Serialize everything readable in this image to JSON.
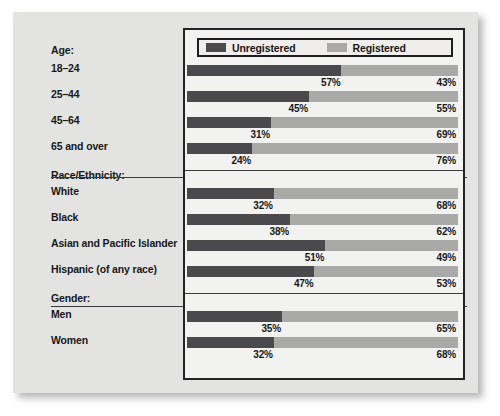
{
  "chart_data": {
    "type": "bar",
    "subtype": "stacked-horizontal-100-percent",
    "title": "",
    "xlabel": "",
    "ylabel": "",
    "xlim": [
      0,
      100
    ],
    "grid": false,
    "legend_position": "top-inside",
    "unit": "%",
    "legend": [
      {
        "name": "Unregistered",
        "color": "#4a4a4c"
      },
      {
        "name": "Registered",
        "color": "#a9a9a7"
      }
    ],
    "series": [
      {
        "name": "Unregistered",
        "color": "#4a4a4c",
        "values": [
          57,
          45,
          31,
          24,
          32,
          38,
          51,
          47,
          35,
          32
        ]
      },
      {
        "name": "Registered",
        "color": "#a9a9a7",
        "values": [
          43,
          55,
          69,
          76,
          68,
          62,
          49,
          53,
          65,
          68
        ]
      }
    ],
    "categories": [
      "18–24",
      "25–44",
      "45–64",
      "65 and over",
      "White",
      "Black",
      "Asian and Pacific Islander",
      "Hispanic (of any race)",
      "Men",
      "Women"
    ],
    "groups": [
      {
        "heading": "Age:",
        "rows": [
          {
            "label": "18–24",
            "unregistered": 57,
            "registered": 43,
            "unregistered_text": "57%",
            "registered_text": "43%"
          },
          {
            "label": "25–44",
            "unregistered": 45,
            "registered": 55,
            "unregistered_text": "45%",
            "registered_text": "55%"
          },
          {
            "label": "45–64",
            "unregistered": 31,
            "registered": 69,
            "unregistered_text": "31%",
            "registered_text": "69%"
          },
          {
            "label": "65 and over",
            "unregistered": 24,
            "registered": 76,
            "unregistered_text": "24%",
            "registered_text": "76%"
          }
        ]
      },
      {
        "heading": "Race/Ethnicity:",
        "rows": [
          {
            "label": "White",
            "unregistered": 32,
            "registered": 68,
            "unregistered_text": "32%",
            "registered_text": "68%"
          },
          {
            "label": "Black",
            "unregistered": 38,
            "registered": 62,
            "unregistered_text": "38%",
            "registered_text": "62%"
          },
          {
            "label": "Asian and Pacific Islander",
            "unregistered": 51,
            "registered": 49,
            "unregistered_text": "51%",
            "registered_text": "49%"
          },
          {
            "label": "Hispanic (of any race)",
            "unregistered": 47,
            "registered": 53,
            "unregistered_text": "47%",
            "registered_text": "53%"
          }
        ]
      },
      {
        "heading": "Gender:",
        "rows": [
          {
            "label": "Men",
            "unregistered": 35,
            "registered": 65,
            "unregistered_text": "35%",
            "registered_text": "65%"
          },
          {
            "label": "Women",
            "unregistered": 32,
            "registered": 68,
            "unregistered_text": "32%",
            "registered_text": "68%"
          }
        ]
      }
    ]
  },
  "colors": {
    "unregistered": "#4a4a4c",
    "registered": "#a9a9a7",
    "panel_background": "#e3e3e1",
    "plot_background": "#f2f2f0",
    "frame_border": "#232325",
    "text": "#18181a"
  }
}
